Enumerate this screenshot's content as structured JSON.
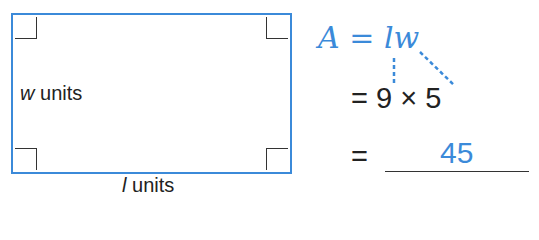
{
  "figure": {
    "rectangle": {
      "width_label": {
        "var": "w",
        "unit": " units"
      },
      "length_label": {
        "var": "l",
        "unit": " units"
      },
      "border_color": "#3b8ad9"
    },
    "formula": {
      "lhs": "A",
      "equals": " = ",
      "rhs": "lw"
    },
    "substitution": {
      "equals": "=",
      "expression": "9 × 5"
    },
    "result": {
      "equals": "=",
      "answer": "45"
    },
    "accent_color": "#3b8ad9"
  }
}
